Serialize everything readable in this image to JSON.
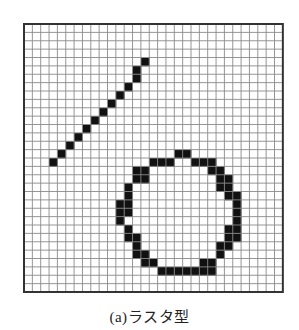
{
  "figure": {
    "caption": "(a)ラスタ型",
    "grid": {
      "columns": 31,
      "rows": 32,
      "cell_width": 8.35,
      "cell_height": 8.375,
      "grid_line_color": "#8a8a8a",
      "border_color": "#333333",
      "fill_color": "#111111",
      "background": "#ffffff"
    },
    "shapes": [
      {
        "name": "diagonal-line",
        "cells": [
          [
            3,
            16
          ],
          [
            4,
            15
          ],
          [
            5,
            14
          ],
          [
            6,
            13
          ],
          [
            7,
            12
          ],
          [
            8,
            11
          ],
          [
            9,
            10
          ],
          [
            10,
            9
          ],
          [
            11,
            8
          ],
          [
            12,
            7
          ],
          [
            13,
            6
          ],
          [
            13,
            5
          ],
          [
            14,
            4
          ]
        ]
      },
      {
        "name": "circle",
        "cells": [
          [
            18,
            15
          ],
          [
            19,
            15
          ],
          [
            15,
            16
          ],
          [
            16,
            16
          ],
          [
            17,
            16
          ],
          [
            20,
            16
          ],
          [
            21,
            16
          ],
          [
            22,
            16
          ],
          [
            13,
            17
          ],
          [
            14,
            17
          ],
          [
            22,
            17
          ],
          [
            23,
            17
          ],
          [
            13,
            18
          ],
          [
            14,
            18
          ],
          [
            23,
            18
          ],
          [
            24,
            18
          ],
          [
            12,
            19
          ],
          [
            23,
            19
          ],
          [
            24,
            19
          ],
          [
            12,
            20
          ],
          [
            24,
            20
          ],
          [
            25,
            20
          ],
          [
            11,
            21
          ],
          [
            12,
            21
          ],
          [
            25,
            21
          ],
          [
            11,
            22
          ],
          [
            12,
            22
          ],
          [
            25,
            22
          ],
          [
            11,
            23
          ],
          [
            25,
            23
          ],
          [
            12,
            24
          ],
          [
            24,
            24
          ],
          [
            25,
            24
          ],
          [
            12,
            25
          ],
          [
            13,
            25
          ],
          [
            24,
            25
          ],
          [
            25,
            25
          ],
          [
            13,
            26
          ],
          [
            23,
            26
          ],
          [
            24,
            26
          ],
          [
            13,
            27
          ],
          [
            14,
            27
          ],
          [
            23,
            27
          ],
          [
            14,
            28
          ],
          [
            15,
            28
          ],
          [
            21,
            28
          ],
          [
            22,
            28
          ],
          [
            16,
            29
          ],
          [
            17,
            29
          ],
          [
            18,
            29
          ],
          [
            19,
            29
          ],
          [
            20,
            29
          ],
          [
            21,
            29
          ],
          [
            22,
            29
          ]
        ]
      }
    ]
  }
}
